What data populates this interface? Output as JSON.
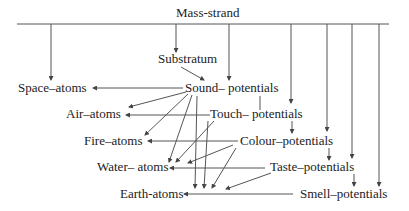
{
  "title": "Mass-strand",
  "nodes": {
    "mass_strand": "Mass-strand",
    "substratum": "Substratum",
    "sound_potentials": "Sound– potentials",
    "touch_potentials": "Touch– potentials",
    "colour_potentials": "Colour–potentials",
    "taste_potentials": "Taste–potentials",
    "smell_potentials": "Smell–potentials",
    "space_atoms": "Space–atoms",
    "air_atoms": "Air–atoms",
    "fire_atoms": "Fire–atoms",
    "water_atoms": "Water– atoms",
    "earth_atoms": "Earth-atoms"
  },
  "colors": {
    "line": "#555555",
    "text": "#222222",
    "background": "#ffffff"
  }
}
